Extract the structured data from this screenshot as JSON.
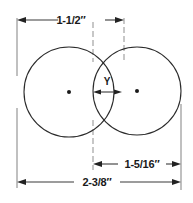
{
  "drawing": {
    "title": "Two overlapping circles dimensioned drawing",
    "units": "inches",
    "background_color": "#ffffff",
    "line_color": "#2b2b2b",
    "extension_line_color": "#8c8c8c",
    "center_line_color": "#9a9a9a",
    "text_color": "#1a1a1a"
  },
  "dimensions": {
    "top": {
      "label": "1-1/2″",
      "name": "top-dimension",
      "value": "1-1/2",
      "unit": "inch"
    },
    "middle": {
      "label": "Y",
      "name": "overlap-dimension",
      "value": "Y",
      "unit": "unknown"
    },
    "right": {
      "label": "1-5/16″",
      "name": "right-dimension",
      "value": "1-5/16",
      "unit": "inch"
    },
    "bottom": {
      "label": "2-3/8″",
      "name": "overall-dimension",
      "value": "2-3/8",
      "unit": "inch"
    }
  },
  "shapes": {
    "left_circle": {
      "name": "left-circle",
      "cx": 69,
      "cy": 92,
      "r": 45
    },
    "right_circle": {
      "name": "right-circle",
      "cx": 137,
      "cy": 91,
      "r": 44
    }
  }
}
